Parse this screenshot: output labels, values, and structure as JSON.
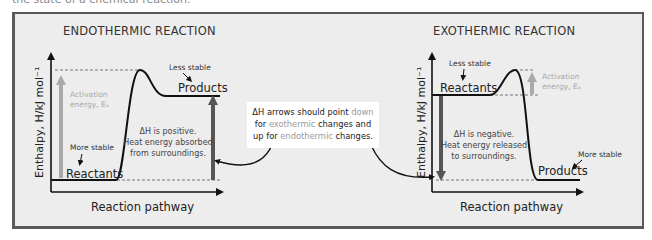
{
  "caption": "the state of a chemical reaction.",
  "note": {
    "line1_pre": "ΔH arrows should point ",
    "line1_word": "down",
    "line2_pre": "for ",
    "line2_word": "exothermic",
    "line2_post": " changes and",
    "line3_pre": "up for ",
    "line3_word": "endothermic",
    "line3_post": " changes."
  },
  "endothermic": {
    "title": "ENDOTHERMIC REACTION",
    "y_axis_label": "Enthalpy, H/kJ mol⁻¹",
    "x_axis_label": "Reaction pathway",
    "reactants_label": "Reactants",
    "products_label": "Products",
    "reactants_stability": "More stable",
    "products_stability": "Less stable",
    "activation_line1": "Activation",
    "activation_line2": "energy, Eₐ",
    "delta_h_line1": "ΔH is positive.",
    "delta_h_line2": "Heat energy absorbed",
    "delta_h_line3": "from surroundings."
  },
  "exothermic": {
    "title": "EXOTHERMIC REACTION",
    "y_axis_label": "Enthalpy, H/kJ mol⁻¹",
    "x_axis_label": "Reaction pathway",
    "reactants_label": "Reactants",
    "products_label": "Products",
    "reactants_stability": "Less stable",
    "products_stability": "More stable",
    "activation_line1": "Activation",
    "activation_line2": "energy, Eₐ",
    "delta_h_line1": "ΔH is negative.",
    "delta_h_line2": "Heat energy released",
    "delta_h_line3": "to surroundings."
  },
  "colors": {
    "frame_border": "#5a5a5a",
    "frame_bg": "#ededed",
    "curve": "#111111",
    "delta_h_arrow": "#555555",
    "activation_arrow": "#a9a9a9"
  }
}
